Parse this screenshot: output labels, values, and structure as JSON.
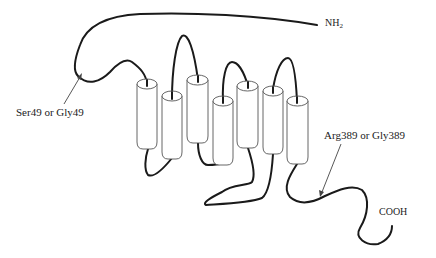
{
  "diagram": {
    "type": "transmembrane-receptor-topology",
    "helix_count": 7,
    "labels": {
      "n_terminus": "NH",
      "n_terminus_subscript": "2",
      "c_terminus": "COOH",
      "polymorphism_1": "Ser49 or Gly49",
      "polymorphism_2": "Arg389 or Gly389"
    },
    "colors": {
      "chain": "#1a1a1a",
      "helix_outline": "#555555",
      "arrow": "#444444",
      "text": "#222222",
      "background": "#ffffff"
    }
  }
}
